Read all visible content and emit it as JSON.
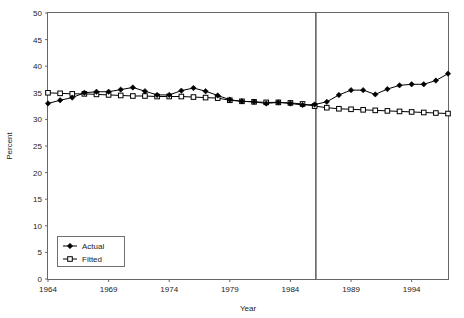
{
  "chart_data": {
    "type": "line",
    "title": "",
    "xlabel": "Year",
    "ylabel": "Percent",
    "xlim": [
      1964,
      1997
    ],
    "ylim": [
      0,
      50
    ],
    "ytick_step": 5,
    "xtick_step": 5,
    "grid": false,
    "legend_position": "bottom-left",
    "xticks": [
      "1964",
      "1969",
      "1974",
      "1979",
      "1984",
      "1989",
      "1994"
    ],
    "xtick_values": [
      1964,
      1969,
      1974,
      1979,
      1984,
      1989,
      1994
    ],
    "yticks": [
      "0",
      "5",
      "10",
      "15",
      "20",
      "25",
      "30",
      "35",
      "40",
      "45",
      "50"
    ],
    "ytick_values": [
      0,
      5,
      10,
      15,
      20,
      25,
      30,
      35,
      40,
      45,
      50
    ],
    "x": [
      1964,
      1965,
      1966,
      1967,
      1968,
      1969,
      1970,
      1971,
      1972,
      1973,
      1974,
      1975,
      1976,
      1977,
      1978,
      1979,
      1980,
      1981,
      1982,
      1983,
      1984,
      1985,
      1986,
      1987,
      1988,
      1989,
      1990,
      1991,
      1992,
      1993,
      1994,
      1995,
      1996,
      1997
    ],
    "series": [
      {
        "name": "Actual",
        "marker": "filled-diamond",
        "values": [
          33.0,
          33.6,
          34.1,
          35.0,
          35.2,
          35.2,
          35.6,
          36.0,
          35.3,
          34.6,
          34.6,
          35.4,
          35.9,
          35.3,
          34.5,
          33.7,
          33.4,
          33.3,
          33.0,
          33.2,
          33.0,
          32.7,
          32.8,
          33.3,
          34.6,
          35.5,
          35.5,
          34.7,
          35.7,
          36.4,
          36.6,
          36.6,
          37.3,
          38.6
        ]
      },
      {
        "name": "Fitted",
        "marker": "open-square",
        "values": [
          35.0,
          34.9,
          34.8,
          34.8,
          34.7,
          34.6,
          34.5,
          34.4,
          34.4,
          34.3,
          34.3,
          34.3,
          34.2,
          34.1,
          34.0,
          33.6,
          33.4,
          33.3,
          33.2,
          33.2,
          33.1,
          32.9,
          32.5,
          32.2,
          32.0,
          31.9,
          31.8,
          31.7,
          31.6,
          31.5,
          31.4,
          31.3,
          31.2,
          31.1
        ]
      }
    ],
    "annotations": [
      {
        "name": "forecast-divider",
        "type": "vertical-line",
        "x": 1986.1
      }
    ],
    "legend": [
      {
        "label": "Actual",
        "marker": "filled-diamond"
      },
      {
        "label": "Fitted",
        "marker": "open-square"
      }
    ]
  }
}
